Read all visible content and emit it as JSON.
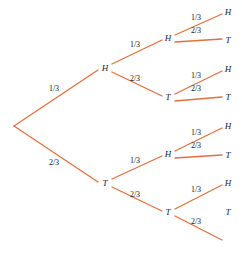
{
  "diagram": {
    "type": "probability-tree",
    "title": "",
    "colors": {
      "branch": "#e0713c",
      "node_text": "#1b1b3a",
      "label_text": "#14142b",
      "background": "#ffffff"
    },
    "root": {
      "x": 14,
      "y": 126,
      "label": ""
    },
    "nodes": [
      {
        "id": "h1",
        "label": "H",
        "x": 105,
        "y": 68,
        "level": 1
      },
      {
        "id": "t1",
        "label": "T",
        "x": 105,
        "y": 183,
        "level": 1
      },
      {
        "id": "h2a",
        "label": "H",
        "x": 168,
        "y": 38,
        "level": 2
      },
      {
        "id": "t2a",
        "label": "T",
        "x": 168,
        "y": 97,
        "level": 2
      },
      {
        "id": "h2b",
        "label": "H",
        "x": 168,
        "y": 154,
        "level": 2
      },
      {
        "id": "t2b",
        "label": "T",
        "x": 168,
        "y": 212,
        "level": 2
      },
      {
        "id": "l1",
        "label": "H",
        "x": 228,
        "y": 12,
        "level": 3
      },
      {
        "id": "l2",
        "label": "T",
        "x": 228,
        "y": 40,
        "level": 3
      },
      {
        "id": "l3",
        "label": "H",
        "x": 228,
        "y": 69,
        "level": 3
      },
      {
        "id": "l4",
        "label": "T",
        "x": 228,
        "y": 97,
        "level": 3
      },
      {
        "id": "l5",
        "label": "H",
        "x": 228,
        "y": 126,
        "level": 3
      },
      {
        "id": "l6",
        "label": "T",
        "x": 228,
        "y": 155,
        "level": 3
      },
      {
        "id": "l7",
        "label": "H",
        "x": 228,
        "y": 183,
        "level": 3
      },
      {
        "id": "l8",
        "label": "T",
        "x": 228,
        "y": 212,
        "level": 3
      }
    ],
    "edges": [
      {
        "id": "e-root-h1",
        "x1": 14,
        "y1": 126,
        "x2": 98,
        "y2": 70,
        "label": "1/3",
        "lx": 54,
        "ly": 89
      },
      {
        "id": "e-root-t1",
        "x1": 14,
        "y1": 126,
        "x2": 98,
        "y2": 182,
        "label": "2/3",
        "lx": 54,
        "ly": 163
      },
      {
        "id": "e-h1-h2a",
        "x1": 112,
        "y1": 64,
        "x2": 162,
        "y2": 40,
        "label": "1/3",
        "lx": 135,
        "ly": 45
      },
      {
        "id": "e-h1-t2a",
        "x1": 112,
        "y1": 72,
        "x2": 162,
        "y2": 96,
        "label": "2/3",
        "lx": 135,
        "ly": 79
      },
      {
        "id": "e-t1-h2b",
        "x1": 112,
        "y1": 179,
        "x2": 162,
        "y2": 156,
        "label": "1/3",
        "lx": 135,
        "ly": 161
      },
      {
        "id": "e-t1-t2b",
        "x1": 112,
        "y1": 187,
        "x2": 162,
        "y2": 211,
        "label": "2/3",
        "lx": 135,
        "ly": 195
      },
      {
        "id": "e-h2a-l1",
        "x1": 175,
        "y1": 35,
        "x2": 222,
        "y2": 14,
        "label": "1/3",
        "lx": 196,
        "ly": 18
      },
      {
        "id": "e-h2a-l2",
        "x1": 175,
        "y1": 42,
        "x2": 222,
        "y2": 39,
        "label": "2/3",
        "lx": 196,
        "ly": 31
      },
      {
        "id": "e-t2a-l3",
        "x1": 175,
        "y1": 94,
        "x2": 222,
        "y2": 71,
        "label": "1/3",
        "lx": 196,
        "ly": 76
      },
      {
        "id": "e-t2a-l4",
        "x1": 175,
        "y1": 101,
        "x2": 222,
        "y2": 97,
        "label": "2/3",
        "lx": 196,
        "ly": 89
      },
      {
        "id": "e-h2b-l5",
        "x1": 175,
        "y1": 151,
        "x2": 222,
        "y2": 128,
        "label": "1/3",
        "lx": 196,
        "ly": 133
      },
      {
        "id": "e-h2b-l6",
        "x1": 175,
        "y1": 158,
        "x2": 222,
        "y2": 155,
        "label": "2/3",
        "lx": 196,
        "ly": 146
      },
      {
        "id": "e-t2b-l7",
        "x1": 175,
        "y1": 209,
        "x2": 222,
        "y2": 185,
        "label": "1/3",
        "lx": 196,
        "ly": 190
      },
      {
        "id": "e-t2b-l8",
        "x1": 175,
        "y1": 216,
        "x2": 222,
        "y2": 240,
        "label": "2/3",
        "lx": 196,
        "ly": 222
      }
    ]
  }
}
